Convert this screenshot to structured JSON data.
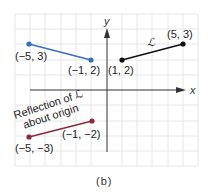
{
  "figure": {
    "caption": "(b)",
    "axes": {
      "x_label": "x",
      "y_label": "y",
      "x_range": [
        -6,
        6
      ],
      "y_range": [
        -5,
        5
      ]
    },
    "colors": {
      "grid": "#e6e6e6",
      "axis": "#333333",
      "segment_L": "#111111",
      "segment_reflect_y": "#3a6fc0",
      "segment_reflect_origin": "#8b2a3a"
    },
    "segments": [
      {
        "name": "L",
        "label": "ℒ",
        "color": "#111111",
        "points": [
          {
            "x": 1,
            "y": 2,
            "label": "(1, 2)"
          },
          {
            "x": 5,
            "y": 3,
            "label": "(5, 3)"
          }
        ]
      },
      {
        "name": "reflection-y-axis",
        "color": "#3a6fc0",
        "points": [
          {
            "x": -5,
            "y": 3,
            "label": "(−5, 3)"
          },
          {
            "x": -1,
            "y": 2,
            "label": "(−1, 2)"
          }
        ]
      },
      {
        "name": "reflection-origin",
        "color": "#8b2a3a",
        "annotation_line1": "Reflection of ℒ",
        "annotation_line2": "about origin",
        "points": [
          {
            "x": -5,
            "y": -3,
            "label": "(−5, −3)"
          },
          {
            "x": -1,
            "y": -2,
            "label": "(−1, −2)"
          }
        ]
      }
    ]
  }
}
